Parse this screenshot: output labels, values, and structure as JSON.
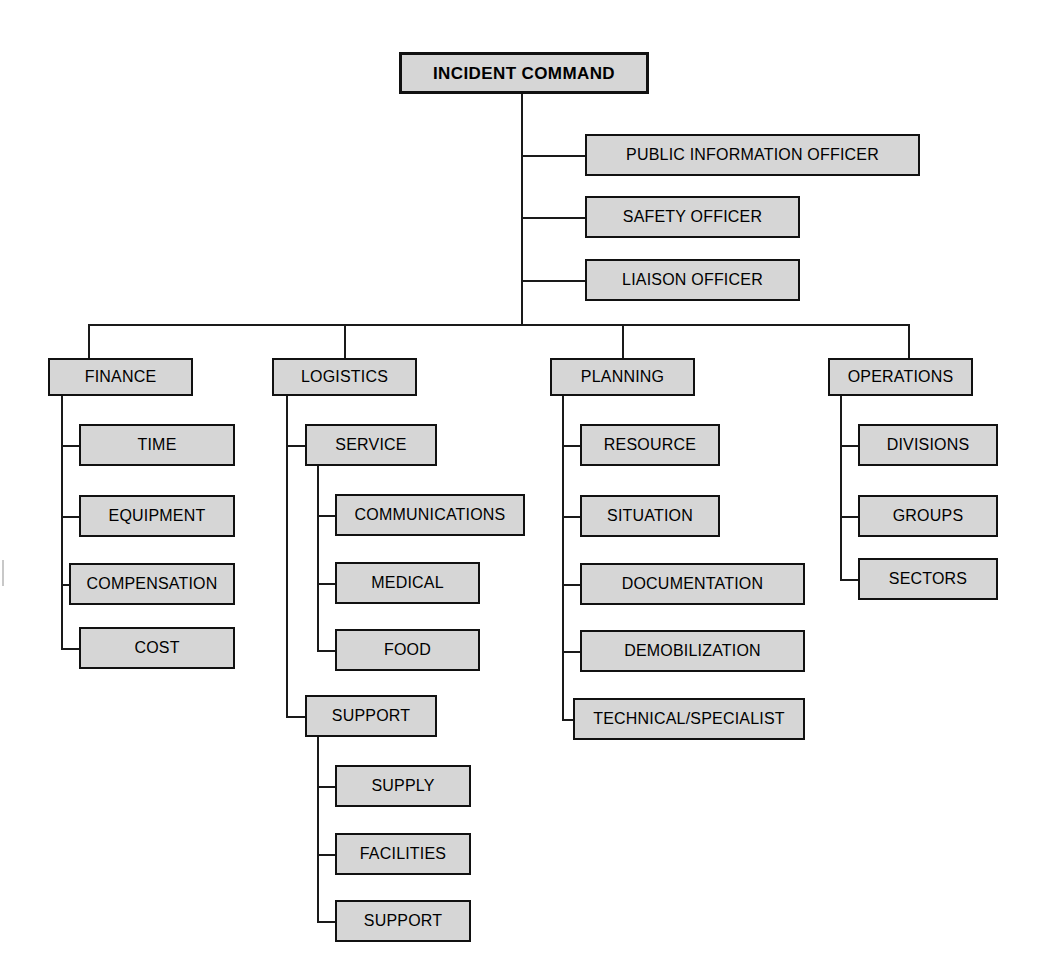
{
  "diagram": {
    "box_fill": "#d6d6d6",
    "box_border": "#111111",
    "line_color": "#1a1a1a",
    "background": "#ffffff"
  },
  "root": {
    "label": "INCIDENT COMMAND"
  },
  "command_staff": [
    {
      "label": "PUBLIC INFORMATION OFFICER"
    },
    {
      "label": "SAFETY OFFICER"
    },
    {
      "label": "LIAISON OFFICER"
    }
  ],
  "sections": [
    {
      "label": "FINANCE",
      "children": [
        {
          "label": "TIME"
        },
        {
          "label": "EQUIPMENT"
        },
        {
          "label": "COMPENSATION"
        },
        {
          "label": "COST"
        }
      ]
    },
    {
      "label": "LOGISTICS",
      "children": [
        {
          "label": "SERVICE",
          "children": [
            {
              "label": "COMMUNICATIONS"
            },
            {
              "label": "MEDICAL"
            },
            {
              "label": "FOOD"
            }
          ]
        },
        {
          "label": "SUPPORT",
          "children": [
            {
              "label": "SUPPLY"
            },
            {
              "label": "FACILITIES"
            },
            {
              "label": "SUPPORT"
            }
          ]
        }
      ]
    },
    {
      "label": "PLANNING",
      "children": [
        {
          "label": "RESOURCE"
        },
        {
          "label": "SITUATION"
        },
        {
          "label": "DOCUMENTATION"
        },
        {
          "label": "DEMOBILIZATION"
        },
        {
          "label": "TECHNICAL/SPECIALIST"
        }
      ]
    },
    {
      "label": "OPERATIONS",
      "children": [
        {
          "label": "DIVISIONS"
        },
        {
          "label": "GROUPS"
        },
        {
          "label": "SECTORS"
        }
      ]
    }
  ]
}
